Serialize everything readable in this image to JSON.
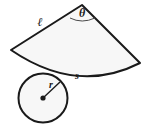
{
  "figure": {
    "background_color": "#ffffff",
    "stroke_color": "#1a1a1a",
    "sector": {
      "name": "circular-sector",
      "fill_color": "#f7f7f7",
      "apex": {
        "x": 82,
        "y": 5
      },
      "left_vertex": {
        "x": 11,
        "y": 50
      },
      "right_vertex": {
        "x": 140,
        "y": 63
      },
      "arc_sweep_direction": "concave-up",
      "labels": {
        "slant_label": "ℓ",
        "arc_label": "s",
        "angle_label": "θ"
      }
    },
    "angle_marker": {
      "name": "angle-arc",
      "label": "θ",
      "label_x": 82,
      "label_y": 16
    },
    "slant_side": {
      "name": "slant-side-left",
      "label": "ℓ",
      "label_x": 40,
      "label_y": 25
    },
    "arc_side": {
      "name": "arc-length",
      "label": "s",
      "label_x": 77,
      "label_y": 78
    },
    "circle": {
      "name": "base-circle",
      "fill_color": "#f7f7f7",
      "center": {
        "x": 43,
        "y": 98
      },
      "radius": 25,
      "radius_label": "r",
      "radius_label_x": 50,
      "radius_label_y": 88,
      "center_dot_radius": 2.6
    }
  }
}
